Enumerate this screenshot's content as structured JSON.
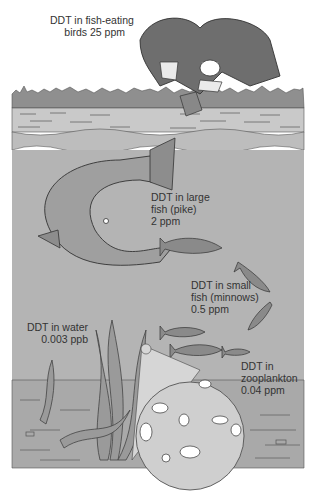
{
  "colors": {
    "background": "#ffffff",
    "sky": "#ffffff",
    "shore": "#8f8f8f",
    "surface_water": "#c9c9c9",
    "deep_water": "#b4b4b4",
    "sediment": "#a9a9a9",
    "magnifier": "#cfcfcf",
    "text": "#333333"
  },
  "levels": [
    {
      "id": "birds",
      "lines": [
        "DDT in fish-eating",
        "birds 25 ppm"
      ],
      "organism": "fish-eating birds (osprey)",
      "concentration": "25 ppm"
    },
    {
      "id": "large-fish",
      "lines": [
        "DDT in large",
        "fish (pike)",
        "2 ppm"
      ],
      "organism": "large fish (pike)",
      "concentration": "2 ppm"
    },
    {
      "id": "small-fish",
      "lines": [
        "DDT in small",
        "fish (minnows)",
        "0.5 ppm"
      ],
      "organism": "small fish (minnows)",
      "concentration": "0.5 ppm"
    },
    {
      "id": "zooplankton",
      "lines": [
        "DDT in",
        "zooplankton",
        "0.04 ppm"
      ],
      "organism": "zooplankton",
      "concentration": "0.04 ppm"
    },
    {
      "id": "water",
      "lines": [
        "DDT in water",
        "0.003 ppb"
      ],
      "organism": "water",
      "concentration": "0.003 ppb"
    }
  ]
}
